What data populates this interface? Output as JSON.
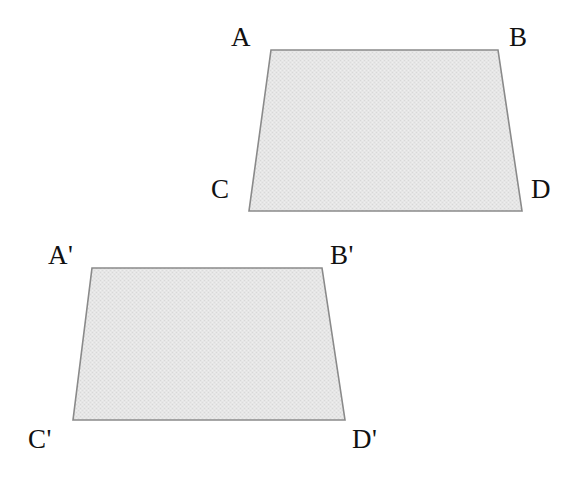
{
  "figure": {
    "background_color": "#ffffff",
    "fill_color": "#e4e4e4",
    "stroke_color": "#8a8a8a",
    "label_color": "#111111",
    "shapes": [
      {
        "name": "quadrilateral-ABCD",
        "points": "271,50 498,50 522,211 249,211",
        "vertices": [
          {
            "label": "A",
            "x": 271,
            "y": 50,
            "label_x": 231,
            "label_y": 24
          },
          {
            "label": "B",
            "x": 498,
            "y": 50,
            "label_x": 509,
            "label_y": 24
          },
          {
            "label": "C",
            "x": 249,
            "y": 211,
            "label_x": 211,
            "label_y": 176
          },
          {
            "label": "D",
            "x": 522,
            "y": 211,
            "label_x": 531,
            "label_y": 176
          }
        ]
      },
      {
        "name": "quadrilateral-ABCD-prime",
        "points": "92,268 322,268 345,420 73,420",
        "vertices": [
          {
            "label": "A'",
            "x": 92,
            "y": 268,
            "label_x": 48,
            "label_y": 242
          },
          {
            "label": "B'",
            "x": 322,
            "y": 268,
            "label_x": 330,
            "label_y": 242
          },
          {
            "label": "C'",
            "x": 73,
            "y": 420,
            "label_x": 28,
            "label_y": 426
          },
          {
            "label": "D'",
            "x": 345,
            "y": 420,
            "label_x": 352,
            "label_y": 426
          }
        ]
      }
    ]
  }
}
